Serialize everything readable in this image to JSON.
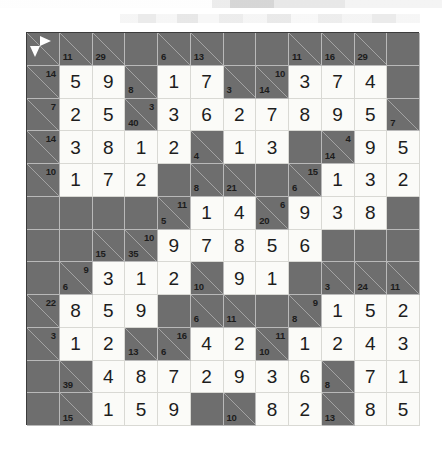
{
  "puzzle": {
    "type": "kakuro",
    "rows": 12,
    "cols": 12,
    "cell_size": 32.75,
    "colors": {
      "block": "#6e6e6e",
      "open": "#fbfbf8",
      "grid_line": "#b9b9b9",
      "digit": "#1d1d1d",
      "clue_text": "#1c1c1c",
      "arrow": "#ffffff"
    },
    "legend": {
      "start_arrow_right": "right-arrow-icon",
      "start_arrow_down": "down-arrow-icon"
    },
    "grid": [
      [
        {
          "t": "clue",
          "arrows": [
            "right",
            "down"
          ]
        },
        {
          "t": "clue",
          "down": "11"
        },
        {
          "t": "clue",
          "down": "29"
        },
        {
          "t": "block"
        },
        {
          "t": "clue",
          "down": "6"
        },
        {
          "t": "clue",
          "down": "13"
        },
        {
          "t": "block"
        },
        {
          "t": "block"
        },
        {
          "t": "clue",
          "down": "11"
        },
        {
          "t": "clue",
          "down": "16"
        },
        {
          "t": "clue",
          "down": "29"
        },
        {
          "t": "block"
        }
      ],
      [
        {
          "t": "clue",
          "across": "14"
        },
        {
          "t": "open",
          "v": "5"
        },
        {
          "t": "open",
          "v": "9"
        },
        {
          "t": "clue",
          "down": "8"
        },
        {
          "t": "open",
          "v": "1"
        },
        {
          "t": "open",
          "v": "7"
        },
        {
          "t": "clue",
          "down": "3"
        },
        {
          "t": "clue",
          "across": "10",
          "down": "14"
        },
        {
          "t": "open",
          "v": "3"
        },
        {
          "t": "open",
          "v": "7"
        },
        {
          "t": "open",
          "v": "4"
        },
        {
          "t": "block"
        }
      ],
      [
        {
          "t": "clue",
          "across": "7"
        },
        {
          "t": "open",
          "v": "2"
        },
        {
          "t": "open",
          "v": "5"
        },
        {
          "t": "clue",
          "across": "3",
          "down": "40"
        },
        {
          "t": "open",
          "v": "3"
        },
        {
          "t": "open",
          "v": "6"
        },
        {
          "t": "open",
          "v": "2"
        },
        {
          "t": "open",
          "v": "7"
        },
        {
          "t": "open",
          "v": "8"
        },
        {
          "t": "open",
          "v": "9"
        },
        {
          "t": "open",
          "v": "5"
        },
        {
          "t": "clue",
          "down": "7"
        }
      ],
      [
        {
          "t": "clue",
          "across": "14"
        },
        {
          "t": "open",
          "v": "3"
        },
        {
          "t": "open",
          "v": "8"
        },
        {
          "t": "open",
          "v": "1"
        },
        {
          "t": "open",
          "v": "2"
        },
        {
          "t": "clue",
          "down": "4"
        },
        {
          "t": "open",
          "v": "1"
        },
        {
          "t": "open",
          "v": "3"
        },
        {
          "t": "block"
        },
        {
          "t": "clue",
          "across": "4",
          "down": "14"
        },
        {
          "t": "open",
          "v": "9"
        },
        {
          "t": "open",
          "v": "5"
        }
      ],
      [
        {
          "t": "clue",
          "across": "10"
        },
        {
          "t": "open",
          "v": "1"
        },
        {
          "t": "open",
          "v": "7"
        },
        {
          "t": "open",
          "v": "2"
        },
        {
          "t": "block"
        },
        {
          "t": "clue",
          "down": "8"
        },
        {
          "t": "clue",
          "down": "21"
        },
        {
          "t": "block"
        },
        {
          "t": "clue",
          "across": "15",
          "down": "6"
        },
        {
          "t": "open",
          "v": "1"
        },
        {
          "t": "open",
          "v": "3"
        },
        {
          "t": "open",
          "v": "2"
        }
      ],
      [
        {
          "t": "block"
        },
        {
          "t": "block"
        },
        {
          "t": "block"
        },
        {
          "t": "block"
        },
        {
          "t": "clue",
          "across": "11",
          "down": "5"
        },
        {
          "t": "open",
          "v": "1"
        },
        {
          "t": "open",
          "v": "4"
        },
        {
          "t": "clue",
          "across": "6",
          "down": "20"
        },
        {
          "t": "open",
          "v": "9"
        },
        {
          "t": "open",
          "v": "3"
        },
        {
          "t": "open",
          "v": "8"
        },
        {
          "t": "block"
        }
      ],
      [
        {
          "t": "block"
        },
        {
          "t": "block"
        },
        {
          "t": "clue",
          "down": "15"
        },
        {
          "t": "clue",
          "across": "10",
          "down": "35"
        },
        {
          "t": "open",
          "v": "9"
        },
        {
          "t": "open",
          "v": "7"
        },
        {
          "t": "open",
          "v": "8"
        },
        {
          "t": "open",
          "v": "5"
        },
        {
          "t": "open",
          "v": "6"
        },
        {
          "t": "block"
        },
        {
          "t": "block"
        },
        {
          "t": "block"
        }
      ],
      [
        {
          "t": "block"
        },
        {
          "t": "clue",
          "across": "9",
          "down": "6"
        },
        {
          "t": "open",
          "v": "3"
        },
        {
          "t": "open",
          "v": "1"
        },
        {
          "t": "open",
          "v": "2"
        },
        {
          "t": "clue",
          "down": "10"
        },
        {
          "t": "open",
          "v": "9"
        },
        {
          "t": "open",
          "v": "1"
        },
        {
          "t": "block"
        },
        {
          "t": "clue",
          "down": "3"
        },
        {
          "t": "clue",
          "down": "24"
        },
        {
          "t": "clue",
          "down": "11"
        }
      ],
      [
        {
          "t": "clue",
          "across": "22"
        },
        {
          "t": "open",
          "v": "8"
        },
        {
          "t": "open",
          "v": "5"
        },
        {
          "t": "open",
          "v": "9"
        },
        {
          "t": "block"
        },
        {
          "t": "clue",
          "down": "6"
        },
        {
          "t": "clue",
          "down": "11"
        },
        {
          "t": "block"
        },
        {
          "t": "clue",
          "across": "9",
          "down": "8"
        },
        {
          "t": "open",
          "v": "1"
        },
        {
          "t": "open",
          "v": "5"
        },
        {
          "t": "open",
          "v": "2"
        }
      ],
      [
        {
          "t": "clue",
          "across": "3"
        },
        {
          "t": "open",
          "v": "1"
        },
        {
          "t": "open",
          "v": "2"
        },
        {
          "t": "clue",
          "down": "13"
        },
        {
          "t": "clue",
          "across": "16",
          "down": "6"
        },
        {
          "t": "open",
          "v": "4"
        },
        {
          "t": "open",
          "v": "2"
        },
        {
          "t": "clue",
          "across": "11",
          "down": "10"
        },
        {
          "t": "open",
          "v": "1"
        },
        {
          "t": "open",
          "v": "2"
        },
        {
          "t": "open",
          "v": "4"
        },
        {
          "t": "open",
          "v": "3"
        }
      ],
      [
        {
          "t": "block"
        },
        {
          "t": "clue",
          "down": "39"
        },
        {
          "t": "open",
          "v": "4"
        },
        {
          "t": "open",
          "v": "8"
        },
        {
          "t": "open",
          "v": "7"
        },
        {
          "t": "open",
          "v": "2"
        },
        {
          "t": "open",
          "v": "9"
        },
        {
          "t": "open",
          "v": "3"
        },
        {
          "t": "open",
          "v": "6"
        },
        {
          "t": "clue",
          "down": "8"
        },
        {
          "t": "open",
          "v": "7"
        },
        {
          "t": "open",
          "v": "1"
        }
      ],
      [
        {
          "t": "block"
        },
        {
          "t": "clue",
          "down": "15"
        },
        {
          "t": "open",
          "v": "1"
        },
        {
          "t": "open",
          "v": "5"
        },
        {
          "t": "open",
          "v": "9"
        },
        {
          "t": "block"
        },
        {
          "t": "clue",
          "down": "10"
        },
        {
          "t": "open",
          "v": "8"
        },
        {
          "t": "open",
          "v": "2"
        },
        {
          "t": "clue",
          "down": "13"
        },
        {
          "t": "open",
          "v": "8"
        },
        {
          "t": "open",
          "v": "5"
        }
      ]
    ]
  }
}
